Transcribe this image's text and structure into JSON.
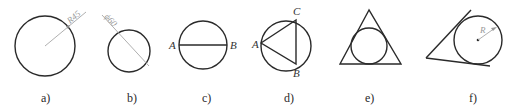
{
  "figures": [
    {
      "caption": "a)",
      "dimension_label": "R45"
    },
    {
      "caption": "b)",
      "dimension_label": "ϕ60"
    },
    {
      "caption": "c)",
      "point_labels": [
        "A",
        "B"
      ]
    },
    {
      "caption": "d)",
      "point_labels": [
        "A",
        "B",
        "C"
      ]
    },
    {
      "caption": "e)"
    },
    {
      "caption": "f)",
      "dimension_label": "R"
    }
  ],
  "colors": {
    "stroke": "#2a2a2a",
    "dimension": "#a8a8a8"
  }
}
